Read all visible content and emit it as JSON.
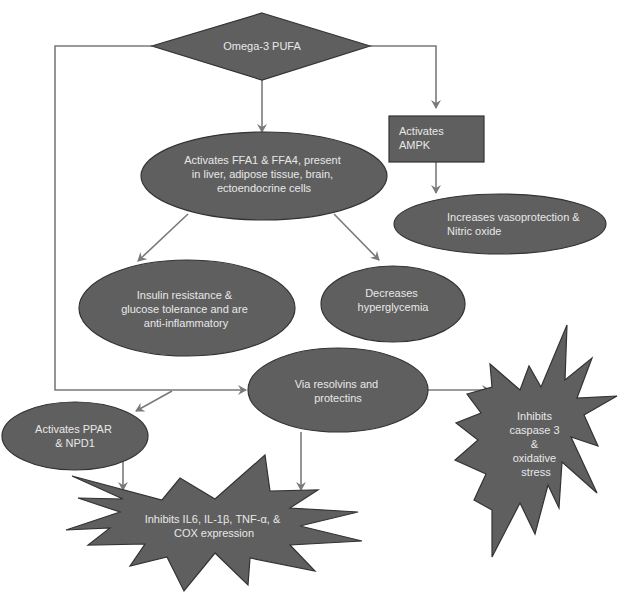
{
  "diagram": {
    "type": "flowchart",
    "colors": {
      "node_fill": "#5f5f5f",
      "node_stroke": "#333333",
      "edge": "#7a7a7a",
      "text": "#e8e8e8",
      "background": "#ffffff"
    },
    "nodes": {
      "omega3": {
        "shape": "diamond",
        "lines": [
          "Omega-3 PUFA"
        ]
      },
      "ampk": {
        "shape": "rectangle",
        "lines": [
          "Activates",
          "AMPK"
        ]
      },
      "ffa": {
        "shape": "ellipse",
        "lines": [
          "Activates FFA1 & FFA4, present",
          "in liver, adipose tissue, brain,",
          "ectoendocrine cells"
        ]
      },
      "vaso": {
        "shape": "ellipse",
        "lines": [
          "Increases vasoprotection &",
          "Nitric oxide"
        ]
      },
      "insulin": {
        "shape": "ellipse",
        "lines": [
          "Insulin resistance &",
          "glucose tolerance and are",
          "anti-inflammatory"
        ]
      },
      "hyper": {
        "shape": "ellipse",
        "lines": [
          "Decreases",
          "hyperglycemia"
        ]
      },
      "resolvins": {
        "shape": "ellipse",
        "lines": [
          "Via resolvins and",
          "protectins"
        ]
      },
      "ppar": {
        "shape": "ellipse",
        "lines": [
          "Activates PPAR",
          "& NPD1"
        ]
      },
      "caspase": {
        "shape": "explosion",
        "lines": [
          "Inhibits",
          "caspase 3",
          "&",
          "oxidative",
          "stress"
        ]
      },
      "inhibits_il6": {
        "shape": "explosion",
        "lines": [
          "Inhibits IL6, IL-1β, TNF-α, &",
          "COX expression"
        ]
      }
    },
    "edges": [
      [
        "omega3",
        "ffa"
      ],
      [
        "omega3",
        "ampk"
      ],
      [
        "omega3",
        "resolvins"
      ],
      [
        "ampk",
        "vaso"
      ],
      [
        "ffa",
        "insulin"
      ],
      [
        "ffa",
        "hyper"
      ],
      [
        "resolvins",
        "ppar"
      ],
      [
        "resolvins",
        "caspase"
      ],
      [
        "resolvins",
        "inhibits_il6"
      ],
      [
        "ppar",
        "inhibits_il6"
      ]
    ]
  }
}
